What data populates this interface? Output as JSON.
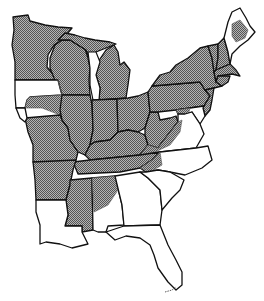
{
  "map": {
    "title": "",
    "region": "Eastern United States",
    "style": "black-and-white line map with crosshatch-shaded range",
    "colors": {
      "outline": "#111111",
      "shaded_fill": "#8a8a8a",
      "unshaded_fill": "#ffffff",
      "background": "#ffffff"
    },
    "legend": null,
    "shaded_states": [
      "Minnesota",
      "Wisconsin",
      "Michigan",
      "Illinois",
      "Indiana",
      "Ohio",
      "Kentucky",
      "Tennessee",
      "West Virginia",
      "Pennsylvania",
      "New York",
      "Vermont",
      "New Hampshire",
      "Massachusetts",
      "Connecticut",
      "Rhode Island",
      "New Jersey",
      "Missouri",
      "Arkansas",
      "Mississippi",
      "Iowa (east)",
      "Maine (central)",
      "Maryland (west)",
      "Virginia (west)",
      "Alabama (north)"
    ],
    "unshaded_states": [
      "Louisiana",
      "Florida",
      "Georgia",
      "South Carolina",
      "North Carolina",
      "Delaware",
      "Maryland (east)",
      "Virginia (east)",
      "Maine (north & coast)",
      "Iowa (west)",
      "Alabama (south)"
    ]
  }
}
